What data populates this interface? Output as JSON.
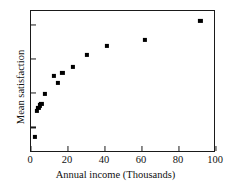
{
  "chart_data": {
    "type": "scatter",
    "title": "",
    "xlabel": "Annual income (Thousands)",
    "ylabel": "Mean satisfaction",
    "xlim": [
      0,
      100
    ],
    "ylim": [
      0,
      1
    ],
    "grid": false,
    "legend": null,
    "marker": "square",
    "marker_color": "#000000",
    "frame_color": "#1a1a1a",
    "background": "#ffffff",
    "xticks": [
      0,
      20,
      40,
      60,
      80,
      100
    ],
    "xticklabels": [
      "0",
      "20",
      "40",
      "60",
      "80",
      "100"
    ],
    "yticks": [
      0.18,
      0.42,
      0.66,
      0.9
    ],
    "yticklabels": [
      "",
      "",
      "",
      ""
    ],
    "points": [
      {
        "x": 2.0,
        "y": 0.115
      },
      {
        "x": 3.2,
        "y": 0.295
      },
      {
        "x": 4.0,
        "y": 0.315
      },
      {
        "x": 4.8,
        "y": 0.335
      },
      {
        "x": 5.6,
        "y": 0.345
      },
      {
        "x": 7.4,
        "y": 0.415
      },
      {
        "x": 12.6,
        "y": 0.545
      },
      {
        "x": 14.4,
        "y": 0.495
      },
      {
        "x": 17.0,
        "y": 0.565
      },
      {
        "x": 22.8,
        "y": 0.605
      },
      {
        "x": 30.4,
        "y": 0.69
      },
      {
        "x": 41.2,
        "y": 0.755
      },
      {
        "x": 61.6,
        "y": 0.795
      },
      {
        "x": 91.6,
        "y": 0.93
      }
    ]
  }
}
